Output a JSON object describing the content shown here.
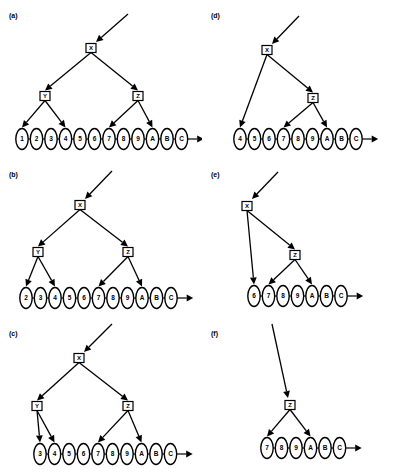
{
  "figure": {
    "background": "#ffffff",
    "stroke": "#000000",
    "panel_count": 6
  },
  "panels": [
    {
      "id": "a",
      "label": "(a)",
      "position": {
        "left": 0,
        "top": 0
      },
      "chain": {
        "nodes": [
          "1",
          "2",
          "3",
          "4",
          "5",
          "6",
          "7",
          "8",
          "9",
          "A",
          "B",
          "C"
        ],
        "start_x": 22,
        "spacing": 14.5,
        "y": 139,
        "terminal_arrow": true
      },
      "boxes": [
        {
          "name": "X",
          "label": "X",
          "x": 91,
          "y": 48
        },
        {
          "name": "Y",
          "label": "Y",
          "x": 45,
          "y": 96
        },
        {
          "name": "Z",
          "label": "Z",
          "x": 138,
          "y": 96
        }
      ],
      "incoming_arrow": {
        "from_x": 128,
        "from_y": 14,
        "to_x": 96,
        "to_y": 42
      },
      "edges": [
        {
          "from": "X",
          "to": "Y"
        },
        {
          "from": "X",
          "to": "Z"
        },
        {
          "from": "Y",
          "to_node": "1"
        },
        {
          "from": "Y",
          "to_node": "4"
        },
        {
          "from": "Z",
          "to_node": "7"
        },
        {
          "from": "Z",
          "to_node": "A"
        }
      ]
    },
    {
      "id": "b",
      "label": "(b)",
      "position": {
        "left": 0,
        "top": 159
      },
      "chain": {
        "nodes": [
          "2",
          "3",
          "4",
          "5",
          "6",
          "7",
          "8",
          "9",
          "A",
          "B",
          "C"
        ],
        "start_x": 26,
        "spacing": 14.5,
        "y": 139,
        "terminal_arrow": true
      },
      "boxes": [
        {
          "name": "X",
          "label": "X",
          "x": 80,
          "y": 46
        },
        {
          "name": "Y",
          "label": "Y",
          "x": 38,
          "y": 93
        },
        {
          "name": "Z",
          "label": "Z",
          "x": 128,
          "y": 93
        }
      ],
      "incoming_arrow": {
        "from_x": 112,
        "from_y": 12,
        "to_x": 85,
        "to_y": 40
      },
      "edges": [
        {
          "from": "X",
          "to": "Y"
        },
        {
          "from": "X",
          "to": "Z"
        },
        {
          "from": "Y",
          "to_node": "2"
        },
        {
          "from": "Y",
          "to_node": "4"
        },
        {
          "from": "Z",
          "to_node": "7"
        },
        {
          "from": "Z",
          "to_node": "A"
        }
      ]
    },
    {
      "id": "c",
      "label": "(c)",
      "position": {
        "left": 0,
        "top": 318
      },
      "chain": {
        "nodes": [
          "3",
          "4",
          "5",
          "6",
          "7",
          "8",
          "9",
          "A",
          "B",
          "C"
        ],
        "start_x": 40,
        "spacing": 14.5,
        "y": 136,
        "terminal_arrow": true
      },
      "boxes": [
        {
          "name": "X",
          "label": "X",
          "x": 79,
          "y": 40
        },
        {
          "name": "Y",
          "label": "Y",
          "x": 37,
          "y": 88
        },
        {
          "name": "Z",
          "label": "Z",
          "x": 128,
          "y": 88
        }
      ],
      "incoming_arrow": {
        "from_x": 112,
        "from_y": 6,
        "to_x": 84,
        "to_y": 34
      },
      "edges": [
        {
          "from": "X",
          "to": "Y"
        },
        {
          "from": "X",
          "to": "Z"
        },
        {
          "from": "Y",
          "to_node": "3"
        },
        {
          "from": "Y",
          "to_node": "4"
        },
        {
          "from": "Z",
          "to_node": "7"
        },
        {
          "from": "Z",
          "to_node": "A"
        }
      ]
    },
    {
      "id": "d",
      "label": "(d)",
      "position": {
        "left": 202,
        "top": 0
      },
      "chain": {
        "nodes": [
          "4",
          "5",
          "6",
          "7",
          "8",
          "9",
          "A",
          "B",
          "C"
        ],
        "start_x": 38,
        "spacing": 14.5,
        "y": 139,
        "terminal_arrow": true
      },
      "boxes": [
        {
          "name": "X",
          "label": "X",
          "x": 65,
          "y": 50
        },
        {
          "name": "Z",
          "label": "Z",
          "x": 111,
          "y": 98
        }
      ],
      "incoming_arrow": {
        "from_x": 97,
        "from_y": 16,
        "to_x": 70,
        "to_y": 44
      },
      "edges": [
        {
          "from": "X",
          "to": "Z"
        },
        {
          "from": "X",
          "to_node": "4"
        },
        {
          "from": "Z",
          "to_node": "7"
        },
        {
          "from": "Z",
          "to_node": "A"
        }
      ]
    },
    {
      "id": "e",
      "label": "(e)",
      "position": {
        "left": 202,
        "top": 159
      },
      "chain": {
        "nodes": [
          "6",
          "7",
          "8",
          "9",
          "A",
          "B",
          "C"
        ],
        "start_x": 52,
        "spacing": 14.5,
        "y": 137,
        "terminal_arrow": true
      },
      "boxes": [
        {
          "name": "X",
          "label": "X",
          "x": 45,
          "y": 47
        },
        {
          "name": "Z",
          "label": "Z",
          "x": 93,
          "y": 96
        }
      ],
      "incoming_arrow": {
        "from_x": 76,
        "from_y": 13,
        "to_x": 50,
        "to_y": 40
      },
      "edges": [
        {
          "from": "X",
          "to": "Z"
        },
        {
          "from": "X",
          "to_node": "6"
        },
        {
          "from": "Z",
          "to_node": "7"
        },
        {
          "from": "Z",
          "to_node": "A"
        }
      ]
    },
    {
      "id": "f",
      "label": "(f)",
      "position": {
        "left": 202,
        "top": 318
      },
      "chain": {
        "nodes": [
          "7",
          "8",
          "9",
          "A",
          "B",
          "C"
        ],
        "start_x": 65,
        "spacing": 14.5,
        "y": 130,
        "terminal_arrow": true
      },
      "boxes": [
        {
          "name": "Z",
          "label": "Z",
          "x": 88,
          "y": 87
        }
      ],
      "incoming_arrow": {
        "from_x": 70,
        "from_y": 6,
        "to_x": 86,
        "to_y": 80
      },
      "edges": [
        {
          "from": "Z",
          "to_node": "7"
        },
        {
          "from": "Z",
          "to_node": "A"
        }
      ]
    }
  ]
}
